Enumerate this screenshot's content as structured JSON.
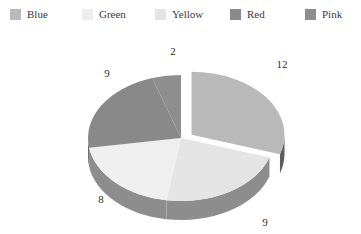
{
  "legend": {
    "items": [
      {
        "label": "Blue",
        "color": "#b9b9b9",
        "icon": "legend-swatch-icon",
        "x": 10
      },
      {
        "label": "Green",
        "color": "#ededed",
        "icon": "legend-swatch-icon",
        "x": 82
      },
      {
        "label": "Yellow",
        "color": "#e4e4e4",
        "icon": "legend-swatch-icon",
        "x": 155
      },
      {
        "label": "Red",
        "color": "#898989",
        "icon": "legend-swatch-icon",
        "x": 230
      },
      {
        "label": "Pink",
        "color": "#8e8e8e",
        "icon": "legend-swatch-icon",
        "x": 305
      }
    ]
  },
  "chart_data": {
    "type": "pie",
    "title": "",
    "subtitle": "",
    "xlabel": "",
    "ylabel": "",
    "legend_position": "top",
    "grid": false,
    "three_d": true,
    "exploded_slice": "Blue",
    "total": 40,
    "categories": [
      "Blue",
      "Green",
      "Yellow",
      "Red",
      "Pink"
    ],
    "values": [
      12,
      9,
      9,
      8,
      2
    ],
    "data_labels": [
      "12",
      "9",
      "9",
      "8",
      "2"
    ],
    "slices": [
      {
        "name": "Blue",
        "value": 12,
        "label": "12",
        "color": "#b9b9b9",
        "side_color": "#5c5c5c",
        "exploded": true,
        "percent": 30.0,
        "label_x": 282,
        "label_y": 65
      },
      {
        "name": "Yellow",
        "value": 9,
        "label": "9",
        "color": "#e4e4e4",
        "side_color": "#8d8d8d",
        "exploded": false,
        "percent": 22.5,
        "label_x": 265,
        "label_y": 223
      },
      {
        "name": "Green",
        "value": 8,
        "label": "8",
        "color": "#efefef",
        "side_color": "#8d8d8d",
        "exploded": false,
        "percent": 20.0,
        "label_x": 101,
        "label_y": 200
      },
      {
        "name": "Red",
        "value": 9,
        "label": "9",
        "color": "#898989",
        "side_color": "#6e6e6e",
        "exploded": false,
        "percent": 22.5,
        "label_x": 107,
        "label_y": 74
      },
      {
        "name": "Pink",
        "value": 2,
        "label": "2",
        "color": "#8e8e8e",
        "side_color": "#6e6e6e",
        "exploded": false,
        "percent": 5.0,
        "label_x": 173,
        "label_y": 52
      }
    ]
  }
}
